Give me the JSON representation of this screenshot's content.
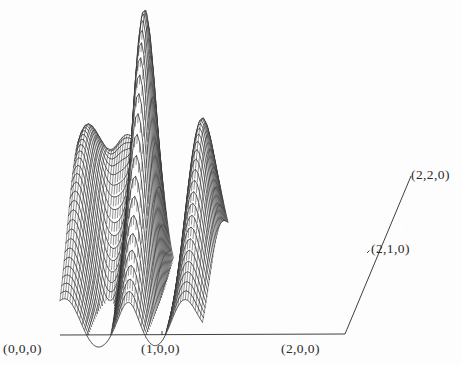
{
  "figure": {
    "kind": "3d-wireframe-surface-plot",
    "background_color": "#fdfdfd",
    "line_color": "#2a2a2a",
    "width": 462,
    "height": 365
  },
  "corner_labels": [
    {
      "name": "origin",
      "text": "(0,0,0)",
      "x": 3,
      "y": 341
    },
    {
      "name": "x-mid",
      "text": "(1,0,0)",
      "x": 141,
      "y": 341
    },
    {
      "name": "x-max",
      "text": "(2,0,0)",
      "x": 281,
      "y": 341
    },
    {
      "name": "y-mid",
      "text": "(2,1,0)",
      "x": 371,
      "y": 241
    },
    {
      "name": "y-max",
      "text": "(2,2,0)",
      "x": 411,
      "y": 167
    }
  ],
  "axes": {
    "front_edge": {
      "x1": 60,
      "y1": 335,
      "x2": 345,
      "y2": 334
    },
    "right_edge": {
      "x1": 345,
      "y1": 334,
      "x2": 411,
      "y2": 176
    },
    "back_edge": {
      "x1": 86,
      "y1": 177,
      "x2": 411,
      "y2": 176
    },
    "ticks": [
      {
        "name": "tick-x-mid",
        "x": 162,
        "y": 335,
        "dx": 0,
        "dy": -4
      },
      {
        "name": "tick-y-mid",
        "x": 367,
        "y": 253,
        "dx": 2.5,
        "dy": -2.5
      }
    ]
  },
  "chart_data": {
    "type": "surface",
    "title": "",
    "xlabel": "",
    "ylabel": "",
    "zlabel": "",
    "xlim": [
      0,
      2
    ],
    "ylim": [
      0,
      2
    ],
    "grid": false,
    "legend": "none",
    "corner_annotations": [
      "(0,0,0)",
      "(1,0,0)",
      "(2,0,0)",
      "(2,1,0)",
      "(2,2,0)"
    ],
    "projection": {
      "origin_px": [
        60,
        335
      ],
      "x_axis_px": [
        142.5,
        -0.5
      ],
      "y_axis_px": [
        25.5,
        -79.0
      ],
      "z_scale_px": 152
    },
    "grid_resolution": {
      "nx": 58,
      "ny": 30
    },
    "peaks": [
      {
        "name": "central-spike",
        "cx": 0.96,
        "cy": 1.22,
        "amp": 1.78,
        "sx": 0.135,
        "sy": 0.6
      },
      {
        "name": "right-ridge",
        "cx": 1.74,
        "cy": 1.26,
        "amp": 1.12,
        "sx": 0.175,
        "sy": 0.72
      },
      {
        "name": "left-crest",
        "cx": 0.1,
        "cy": 1.4,
        "amp": 1.02,
        "sx": 0.22,
        "sy": 0.85
      },
      {
        "name": "mid-hump",
        "cx": 0.58,
        "cy": 1.95,
        "amp": 0.86,
        "sx": 0.2,
        "sy": 0.55
      }
    ],
    "valleys": [
      {
        "name": "left-valley",
        "cx": 0.45,
        "cy": 1.1,
        "amp": 0.34,
        "sx": 0.2,
        "sy": 0.8
      },
      {
        "name": "right-valley",
        "cx": 1.38,
        "cy": 1.2,
        "amp": 0.3,
        "sx": 0.18,
        "sy": 0.8
      }
    ]
  }
}
